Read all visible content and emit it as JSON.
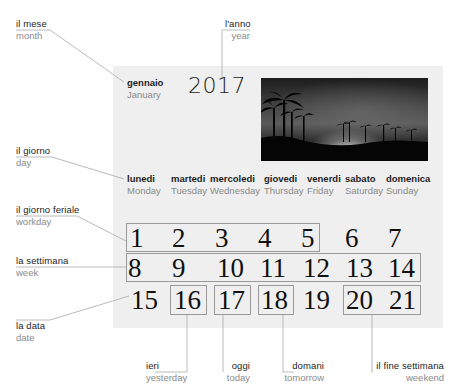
{
  "calendar": {
    "month_it": "gennaio",
    "month_en": "January",
    "year": "2017",
    "photo": "night-palm-trees-silhouette",
    "days": [
      {
        "it": "lunedi",
        "en": "Monday"
      },
      {
        "it": "martedi",
        "en": "Tuesday"
      },
      {
        "it": "mercoledi",
        "en": "Wednesday"
      },
      {
        "it": "giovedi",
        "en": "Thursday"
      },
      {
        "it": "venerdi",
        "en": "Friday"
      },
      {
        "it": "sabato",
        "en": "Saturday"
      },
      {
        "it": "domenica",
        "en": "Sunday"
      }
    ],
    "weeks": [
      [
        "1",
        "2",
        "3",
        "4",
        "5",
        "6",
        "7"
      ],
      [
        "8",
        "9",
        "10",
        "11",
        "12",
        "13",
        "14"
      ],
      [
        "15",
        "16",
        "17",
        "18",
        "19",
        "20",
        "21"
      ]
    ]
  },
  "labels": {
    "month": {
      "it": "il mese",
      "en": "month"
    },
    "year": {
      "it": "l'anno",
      "en": "year"
    },
    "day": {
      "it": "il giorno",
      "en": "day"
    },
    "workday": {
      "it": "il giorno feriale",
      "en": "workday"
    },
    "week": {
      "it": "la settimana",
      "en": "week"
    },
    "date": {
      "it": "la data",
      "en": "date"
    },
    "yesterday": {
      "it": "ieri",
      "en": "yesterday"
    },
    "today": {
      "it": "oggi",
      "en": "today"
    },
    "tomorrow": {
      "it": "domani",
      "en": "tomorrow"
    },
    "weekend": {
      "it": "il fine settimana",
      "en": "weekend"
    }
  },
  "colors": {
    "panel": "#efefef",
    "leader_line": "#a8a8a8",
    "box_border": "#9a9a9a"
  }
}
